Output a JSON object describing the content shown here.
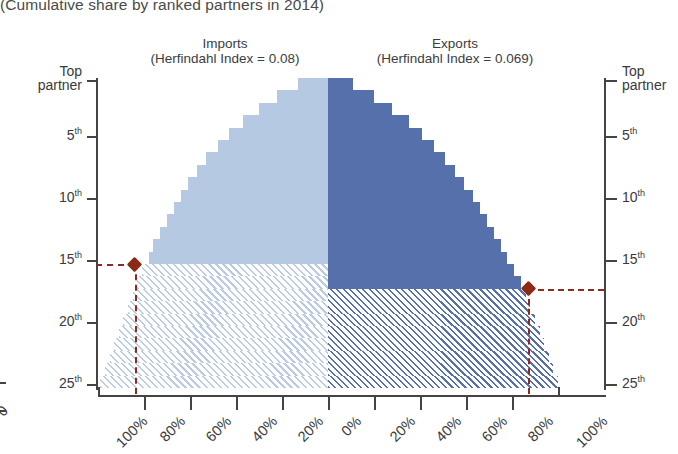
{
  "subtitle": "(Cumulative share by ranked partners in 2014)",
  "panels": {
    "imports": {
      "name": "Imports",
      "index_line": "(Herfindahl Index = 0.08)"
    },
    "exports": {
      "name": "Exports",
      "index_line": "(Herfindahl Index = 0.069)"
    }
  },
  "axes": {
    "y_left_title_line1": "Top",
    "y_left_title_line2": "partner",
    "y_right_title_line1": "Top",
    "y_right_title_line2": "partner",
    "y_ticks": [
      "5",
      "10",
      "15",
      "20",
      "25"
    ],
    "y_tick_suffix": "th",
    "x_ticks_left": [
      "100%",
      "80%",
      "60%",
      "40%",
      "20%",
      "0%"
    ],
    "x_ticks_right": [
      "20%",
      "40%",
      "60%",
      "80%",
      "100%"
    ],
    "x_fragment_label": "0"
  },
  "colors": {
    "imports_fill": "#b6c9e2",
    "exports_fill": "#5670ac",
    "marker": "#8a2a17",
    "axis": "#444444"
  },
  "markers": {
    "imports": {
      "rank_label": "15",
      "share_label": "84%"
    },
    "exports": {
      "rank_label": "17",
      "share_label": "87%"
    }
  },
  "chart_data": {
    "type": "area",
    "title": "",
    "subtitle": "(Cumulative share by ranked partners in 2014)",
    "xlabel": "",
    "ylabel": "Partner rank",
    "orientation": "horizontal-back-to-back",
    "grid": false,
    "legend": "none",
    "xlim": [
      -100,
      100
    ],
    "ylim": [
      1,
      25
    ],
    "y_categories": [
      1,
      2,
      3,
      4,
      5,
      6,
      7,
      8,
      9,
      10,
      11,
      12,
      13,
      14,
      15,
      16,
      17,
      18,
      19,
      20,
      21,
      22,
      23,
      24,
      25
    ],
    "series": [
      {
        "name": "Imports",
        "herfindahl_index": 0.08,
        "color": "#b6c9e2",
        "direction": "left",
        "values": [
          13,
          22,
          30,
          37,
          43,
          48,
          53,
          57,
          61,
          64,
          67,
          70,
          73,
          76,
          78,
          81,
          83,
          85,
          87,
          89,
          91,
          93,
          95,
          97,
          99
        ],
        "solid_until_rank": 15,
        "hatched_from_rank": 16
      },
      {
        "name": "Exports",
        "herfindahl_index": 0.069,
        "color": "#5670ac",
        "direction": "right",
        "values": [
          11,
          20,
          28,
          35,
          41,
          46,
          51,
          55,
          59,
          63,
          66,
          69,
          72,
          75,
          78,
          81,
          84,
          86,
          88,
          90,
          92,
          94,
          96,
          98,
          100
        ],
        "solid_until_rank": 17,
        "hatched_from_rank": 18
      }
    ],
    "annotations": [
      {
        "series": "Imports",
        "rank": 15,
        "share": 84,
        "marker": "diamond",
        "color": "#8a2a17"
      },
      {
        "series": "Exports",
        "rank": 17,
        "share": 87,
        "marker": "diamond",
        "color": "#8a2a17"
      }
    ]
  }
}
